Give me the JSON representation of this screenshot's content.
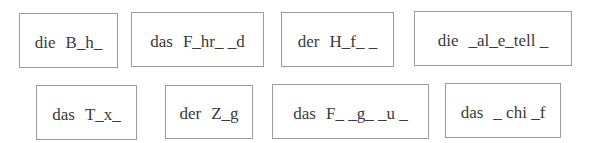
{
  "worksheet": {
    "exercise": "fill-in-the-missing-letters",
    "rows": [
      {
        "items": [
          {
            "article": "die",
            "word": "B_h_"
          },
          {
            "article": "das",
            "word": "F_hr_ _d"
          },
          {
            "article": "der",
            "word": "H_f_ _"
          },
          {
            "article": "die",
            "word": "_al_e_tell _"
          }
        ]
      },
      {
        "items": [
          {
            "article": "das",
            "word": "T_x_"
          },
          {
            "article": "der",
            "word": "Z_g"
          },
          {
            "article": "das",
            "word": "F_ _g_ _u _"
          },
          {
            "article": "das",
            "word": "_ chi _f"
          }
        ]
      }
    ],
    "colors": {
      "border": "#9a9a9a",
      "text": "#3a3a3a",
      "background": "#ffffff"
    }
  }
}
